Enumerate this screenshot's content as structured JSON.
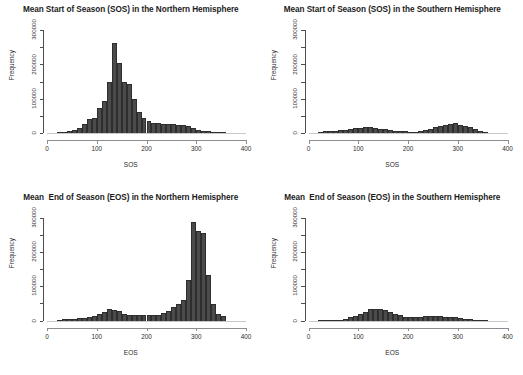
{
  "figure": {
    "background": "#ffffff",
    "bar_fill": "#4b4b4b",
    "bar_border": "#2e2e2e",
    "axis_color": "#4d4d4d"
  },
  "chart_data": [
    {
      "type": "bar",
      "panel": "top-left",
      "title": "Mean Start of Season (SOS) in the Northern Hemisphere",
      "xlabel": "SOS",
      "ylabel": "Frequency",
      "xlim": [
        0,
        400
      ],
      "ylim": [
        0,
        300000
      ],
      "xticks": [
        0,
        100,
        200,
        300,
        400
      ],
      "xtick_labels": [
        "0",
        "100",
        "200",
        "300",
        "400"
      ],
      "yticks": [
        0,
        50000,
        100000,
        150000,
        200000,
        250000,
        300000
      ],
      "ytick_labels": [
        "0",
        "",
        "100000",
        "",
        "200000",
        "",
        "300000"
      ],
      "ytick_labeled": [
        0,
        100000,
        200000,
        300000
      ],
      "grid": false,
      "legend": "none",
      "bin_width": 10,
      "bins": [
        20,
        30,
        40,
        50,
        60,
        70,
        80,
        90,
        100,
        110,
        120,
        130,
        140,
        150,
        160,
        170,
        180,
        190,
        200,
        210,
        220,
        230,
        240,
        250,
        260,
        270,
        280,
        290,
        300,
        310,
        320,
        330,
        340,
        350
      ],
      "values": [
        1500,
        3000,
        5500,
        9000,
        14000,
        26000,
        42000,
        45000,
        72000,
        92000,
        150000,
        262000,
        205000,
        148000,
        143000,
        100000,
        60000,
        45000,
        35000,
        30000,
        28000,
        27000,
        26000,
        25000,
        24000,
        23000,
        19000,
        14000,
        10000,
        7000,
        5000,
        3500,
        2000,
        1000
      ]
    },
    {
      "type": "bar",
      "panel": "top-right",
      "title": "Mean Start of Season (SOS) in the Southern Hemisphere",
      "xlabel": "SOS",
      "ylabel": "Frequency",
      "xlim": [
        0,
        400
      ],
      "ylim": [
        0,
        300000
      ],
      "xticks": [
        0,
        100,
        200,
        300,
        400
      ],
      "xtick_labels": [
        "0",
        "100",
        "200",
        "300",
        "400"
      ],
      "yticks": [
        0,
        50000,
        100000,
        150000,
        200000,
        250000,
        300000
      ],
      "ytick_labels": [
        "0",
        "",
        "100000",
        "",
        "200000",
        "",
        "300000"
      ],
      "ytick_labeled": [
        0,
        100000,
        200000,
        300000
      ],
      "grid": false,
      "legend": "none",
      "bin_width": 10,
      "bins": [
        20,
        30,
        40,
        50,
        60,
        70,
        80,
        90,
        100,
        110,
        120,
        130,
        140,
        150,
        160,
        170,
        180,
        190,
        200,
        210,
        220,
        230,
        240,
        250,
        260,
        270,
        280,
        290,
        300,
        310,
        320,
        330,
        340,
        350
      ],
      "values": [
        3000,
        4500,
        6000,
        7000,
        8500,
        10000,
        12000,
        14000,
        16000,
        17000,
        16500,
        15000,
        13000,
        11000,
        9000,
        7000,
        5500,
        4500,
        4000,
        4000,
        5000,
        8000,
        12000,
        17000,
        20000,
        22000,
        27000,
        29000,
        24000,
        21000,
        17000,
        11000,
        5000,
        1500
      ]
    },
    {
      "type": "bar",
      "panel": "bottom-left",
      "title": "Mean  End of Season (EOS) in the Northern Hemisphere",
      "xlabel": "EOS",
      "ylabel": "Frequency",
      "xlim": [
        0,
        400
      ],
      "ylim": [
        0,
        300000
      ],
      "xticks": [
        0,
        100,
        200,
        300,
        400
      ],
      "xtick_labels": [
        "0",
        "100",
        "200",
        "300",
        "400"
      ],
      "yticks": [
        0,
        50000,
        100000,
        150000,
        200000,
        250000,
        300000
      ],
      "ytick_labels": [
        "0",
        "",
        "100000",
        "",
        "200000",
        "",
        "300000"
      ],
      "ytick_labeled": [
        0,
        100000,
        200000,
        300000
      ],
      "grid": false,
      "legend": "none",
      "bin_width": 10,
      "bins": [
        20,
        30,
        40,
        50,
        60,
        70,
        80,
        90,
        100,
        110,
        120,
        130,
        140,
        150,
        160,
        170,
        180,
        190,
        200,
        210,
        220,
        230,
        240,
        250,
        260,
        270,
        280,
        290,
        300,
        310,
        320,
        330,
        340,
        350
      ],
      "values": [
        2000,
        3000,
        4000,
        5000,
        6000,
        8000,
        10000,
        14000,
        20000,
        26000,
        33000,
        30000,
        28000,
        20000,
        17000,
        16000,
        15000,
        15000,
        15000,
        16000,
        17000,
        22000,
        27000,
        38000,
        47000,
        60000,
        118000,
        288000,
        262000,
        255000,
        133000,
        47000,
        18000,
        13000
      ]
    },
    {
      "type": "bar",
      "panel": "bottom-right",
      "title": "Mean  End of Season (EOS) in the Southern Hemisphere",
      "xlabel": "EOS",
      "ylabel": "Frequency",
      "xlim": [
        0,
        400
      ],
      "ylim": [
        0,
        300000
      ],
      "xticks": [
        0,
        100,
        200,
        300,
        400
      ],
      "xtick_labels": [
        "0",
        "100",
        "200",
        "300",
        "400"
      ],
      "yticks": [
        0,
        50000,
        100000,
        150000,
        200000,
        250000,
        300000
      ],
      "ytick_labels": [
        "0",
        "",
        "100000",
        "",
        "200000",
        "",
        "300000"
      ],
      "ytick_labeled": [
        0,
        100000,
        200000,
        300000
      ],
      "grid": false,
      "legend": "none",
      "bin_width": 10,
      "bins": [
        20,
        30,
        40,
        50,
        60,
        70,
        80,
        90,
        100,
        110,
        120,
        130,
        140,
        150,
        160,
        170,
        180,
        190,
        200,
        210,
        220,
        230,
        240,
        250,
        260,
        270,
        280,
        290,
        300,
        310,
        320,
        330,
        340,
        350
      ],
      "values": [
        500,
        700,
        1000,
        1500,
        2500,
        5000,
        9000,
        14000,
        19000,
        26000,
        33000,
        34000,
        33000,
        30000,
        25000,
        20000,
        15000,
        11000,
        9000,
        9000,
        10000,
        12000,
        13000,
        13000,
        12000,
        11000,
        11000,
        10000,
        8000,
        5000,
        3000,
        1500,
        800,
        300
      ]
    }
  ]
}
